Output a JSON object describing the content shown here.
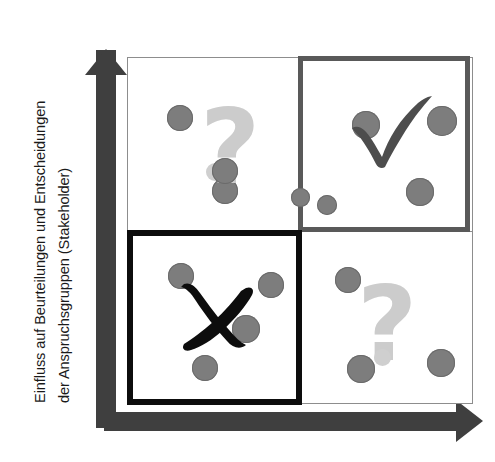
{
  "diagram": {
    "type": "2x2-matrix",
    "title": "",
    "y_axis": {
      "name": "y-axis-label",
      "lines": [
        "Einfluss auf Beurteilungen und Entscheidungen",
        "der Anspruchsgruppen (Stakeholder)"
      ],
      "arrow": "up"
    },
    "x_axis": {
      "name": "x-axis-label",
      "lines": [],
      "arrow": "right"
    },
    "colors": {
      "dot": "#7d7d7d",
      "dot_light": "#cfcfcf",
      "question_mark": "#cccccc",
      "check": "#4d4d4d",
      "cross": "#0d0d0d",
      "frame": "#8d8d8d",
      "highlight_border_strong": "#0d0d0d",
      "highlight_border_medium": "#595959",
      "axis": "#3f3f3f"
    },
    "quadrants": [
      {
        "id": "top-left",
        "symbol": "question-mark",
        "symbol_text": "?",
        "emphasis": "none",
        "border": "thin-gray",
        "dots": [
          {
            "x": 52,
            "y": 60,
            "r": 13
          },
          {
            "x": 97,
            "y": 133,
            "r": 13
          }
        ]
      },
      {
        "id": "top-right",
        "symbol": "check-mark",
        "symbol_text": "✓",
        "emphasis": "medium",
        "border": "thick-dark-gray",
        "dots": [
          {
            "x": 62,
            "y": 63,
            "r": 14
          },
          {
            "x": 139,
            "y": 60,
            "r": 15
          },
          {
            "x": 117,
            "y": 130,
            "r": 14
          }
        ]
      },
      {
        "id": "bottom-left",
        "symbol": "cross-mark",
        "symbol_text": "✗",
        "emphasis": "strong",
        "border": "thick-black",
        "dots": [
          {
            "x": 48,
            "y": 40,
            "r": 13
          },
          {
            "x": 138,
            "y": 49,
            "r": 13
          },
          {
            "x": 112,
            "y": 92,
            "r": 13
          },
          {
            "x": 72,
            "y": 132,
            "r": 13
          }
        ]
      },
      {
        "id": "bottom-right",
        "symbol": "question-mark",
        "symbol_text": "?",
        "emphasis": "none",
        "border": "thin-gray",
        "dots": [
          {
            "x": 46,
            "y": 48,
            "r": 13
          },
          {
            "x": 59,
            "y": 137,
            "r": 14
          },
          {
            "x": 139,
            "y": 131,
            "r": 14
          }
        ]
      },
      {
        "id": "center-boundary",
        "symbol": "none",
        "symbol_text": "",
        "emphasis": "none",
        "border": "none",
        "dots": [
          {
            "x": 300,
            "y": 197,
            "r": 9,
            "absolute": true
          },
          {
            "x": 327,
            "y": 205,
            "r": 10,
            "absolute": true
          }
        ]
      }
    ]
  }
}
